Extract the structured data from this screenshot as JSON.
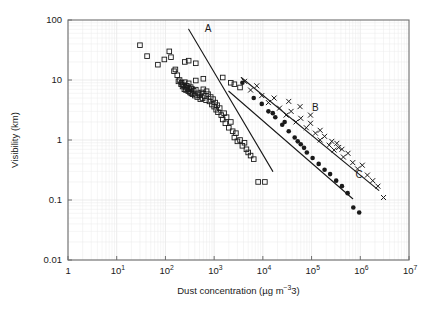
{
  "figure": {
    "background": "#ffffff",
    "frame_color": "#6e6e6e",
    "grid_color": "#ebebeb",
    "marker_color": "#1a1a1a",
    "line_color": "#1a1a1a"
  },
  "chart_data": {
    "type": "scatter",
    "title": "",
    "xlabel": "Dust concentration (µg m−3)",
    "ylabel": "Visibility (km)",
    "xscale": "log",
    "yscale": "log",
    "xlim": [
      1,
      10000000
    ],
    "ylim": [
      0.01,
      100
    ],
    "grid": true,
    "grid_minor": true,
    "legend": "none",
    "xticks": [
      1,
      10,
      100,
      1000,
      10000,
      100000,
      1000000,
      10000000
    ],
    "xtick_labels": [
      "1",
      "10",
      "10",
      "10",
      "10",
      "10",
      "10",
      "10"
    ],
    "xtick_exponents": [
      "",
      "1",
      "2",
      "3",
      "4",
      "5",
      "6",
      "7"
    ],
    "yticks": [
      100,
      10,
      1,
      0.1,
      0.01
    ],
    "ytick_labels": [
      "100",
      "10",
      "1",
      "0.1",
      "0.01"
    ],
    "annotations": [
      {
        "text": "A",
        "x": 750,
        "y": 62
      },
      {
        "text": "B",
        "x": 120000,
        "y": 3.1
      },
      {
        "text": "C",
        "x": 950000,
        "y": 0.23
      }
    ],
    "series": [
      {
        "name": "open-squares",
        "marker": "square-open",
        "points": [
          [
            30,
            38
          ],
          [
            42,
            25
          ],
          [
            70,
            18
          ],
          [
            95,
            22
          ],
          [
            120,
            30
          ],
          [
            130,
            24
          ],
          [
            150,
            14
          ],
          [
            160,
            15
          ],
          [
            175,
            12
          ],
          [
            185,
            9.5
          ],
          [
            195,
            10
          ],
          [
            210,
            8.5
          ],
          [
            215,
            9.0
          ],
          [
            225,
            7.8
          ],
          [
            235,
            8.2
          ],
          [
            245,
            7.0
          ],
          [
            250,
            9.2
          ],
          [
            260,
            7.5
          ],
          [
            265,
            6.8
          ],
          [
            275,
            8.0
          ],
          [
            285,
            7.2
          ],
          [
            295,
            6.5
          ],
          [
            300,
            8.8
          ],
          [
            310,
            7.0
          ],
          [
            320,
            6.2
          ],
          [
            330,
            7.6
          ],
          [
            340,
            6.0
          ],
          [
            350,
            7.1
          ],
          [
            360,
            5.8
          ],
          [
            380,
            6.6
          ],
          [
            400,
            5.5
          ],
          [
            420,
            6.9
          ],
          [
            450,
            5.2
          ],
          [
            470,
            6.0
          ],
          [
            500,
            5.6
          ],
          [
            520,
            4.8
          ],
          [
            550,
            6.2
          ],
          [
            580,
            5.0
          ],
          [
            600,
            7.0
          ],
          [
            640,
            5.4
          ],
          [
            680,
            4.6
          ],
          [
            700,
            6.5
          ],
          [
            750,
            5.8
          ],
          [
            800,
            4.4
          ],
          [
            850,
            5.2
          ],
          [
            900,
            3.9
          ],
          [
            950,
            4.8
          ],
          [
            1000,
            3.6
          ],
          [
            1050,
            4.2
          ],
          [
            1100,
            3.2
          ],
          [
            1150,
            3.8
          ],
          [
            1200,
            2.9
          ],
          [
            1300,
            3.4
          ],
          [
            1400,
            2.6
          ],
          [
            1500,
            2.2
          ],
          [
            1600,
            2.8
          ],
          [
            1700,
            1.9
          ],
          [
            1800,
            2.4
          ],
          [
            2000,
            1.6
          ],
          [
            2200,
            2.0
          ],
          [
            2400,
            1.4
          ],
          [
            2600,
            1.1
          ],
          [
            2800,
            1.3
          ],
          [
            3000,
            0.95
          ],
          [
            3400,
            1.0
          ],
          [
            3800,
            0.8
          ],
          [
            4200,
            0.9
          ],
          [
            4600,
            0.7
          ],
          [
            5000,
            0.62
          ],
          [
            5600,
            0.55
          ],
          [
            6500,
            0.48
          ],
          [
            8000,
            0.2
          ],
          [
            11000,
            0.2
          ],
          [
            250,
            20
          ],
          [
            300,
            21
          ],
          [
            420,
            19
          ],
          [
            1500,
            11
          ],
          [
            2600,
            8.5
          ],
          [
            3400,
            7.5
          ],
          [
            2200,
            9.0
          ],
          [
            600,
            10.5
          ],
          [
            420,
            9.8
          ]
        ]
      },
      {
        "name": "crosses",
        "marker": "x",
        "points": [
          [
            4200,
            9.5
          ],
          [
            5600,
            6.8
          ],
          [
            7500,
            8.0
          ],
          [
            9500,
            5.5
          ],
          [
            13000,
            4.2
          ],
          [
            17000,
            5.0
          ],
          [
            22000,
            3.4
          ],
          [
            30000,
            2.6
          ],
          [
            38000,
            3.0
          ],
          [
            48000,
            2.0
          ],
          [
            60000,
            2.3
          ],
          [
            78000,
            1.6
          ],
          [
            95000,
            1.9
          ],
          [
            120000,
            1.3
          ],
          [
            150000,
            1.0
          ],
          [
            185000,
            1.15
          ],
          [
            230000,
            0.82
          ],
          [
            290000,
            0.68
          ],
          [
            360000,
            0.75
          ],
          [
            450000,
            0.52
          ],
          [
            560000,
            0.6
          ],
          [
            700000,
            0.42
          ],
          [
            880000,
            0.33
          ],
          [
            1100000,
            0.38
          ],
          [
            1400000,
            0.26
          ],
          [
            1800000,
            0.21
          ],
          [
            2300000,
            0.17
          ],
          [
            3000000,
            0.11
          ],
          [
            260000,
            0.95
          ],
          [
            330000,
            0.88
          ],
          [
            420000,
            0.7
          ],
          [
            150000,
            1.45
          ],
          [
            95000,
            2.6
          ],
          [
            58000,
            3.6
          ],
          [
            34000,
            4.4
          ]
        ]
      },
      {
        "name": "filled-circles",
        "marker": "circle-filled",
        "points": [
          [
            3800,
            9.0
          ],
          [
            6500,
            5.0
          ],
          [
            9500,
            4.0
          ],
          [
            13000,
            3.0
          ],
          [
            18000,
            2.4
          ],
          [
            25000,
            1.8
          ],
          [
            34000,
            1.4
          ],
          [
            45000,
            1.1
          ],
          [
            60000,
            0.85
          ],
          [
            80000,
            0.62
          ],
          [
            105000,
            0.5
          ],
          [
            140000,
            0.4
          ],
          [
            185000,
            0.32
          ],
          [
            240000,
            0.27
          ],
          [
            320000,
            0.21
          ],
          [
            420000,
            0.17
          ],
          [
            550000,
            0.13
          ],
          [
            720000,
            0.075
          ],
          [
            950000,
            0.062
          ],
          [
            28000,
            2.0
          ],
          [
            16000,
            2.8
          ],
          [
            52000,
            0.95
          ],
          [
            70000,
            0.74
          ]
        ]
      }
    ],
    "fit_lines": [
      {
        "label": "A",
        "x1": 300,
        "y1": 70,
        "x2": 16000,
        "y2": 0.3
      },
      {
        "label": "B",
        "x1": 3600,
        "y1": 11.0,
        "x2": 2400000,
        "y2": 0.145
      },
      {
        "label": "C",
        "x1": 2000,
        "y1": 6.5,
        "x2": 700000,
        "y2": 0.105
      }
    ]
  }
}
